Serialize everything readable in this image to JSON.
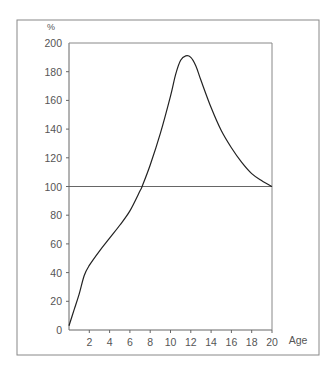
{
  "chart_data": {
    "type": "line",
    "title": "",
    "xlabel": "Age",
    "ylabel": "%",
    "xlim": [
      0,
      20
    ],
    "ylim": [
      0,
      200
    ],
    "x_ticks": [
      2,
      4,
      6,
      8,
      10,
      12,
      14,
      16,
      18,
      20
    ],
    "y_ticks": [
      0,
      20,
      40,
      60,
      80,
      100,
      120,
      140,
      160,
      180,
      200
    ],
    "grid": false,
    "legend": null,
    "reference_line": {
      "y": 100,
      "orientation": "horizontal"
    },
    "series": [
      {
        "name": "curve",
        "x": [
          0,
          0.5,
          1,
          1.5,
          2,
          3,
          4,
          5,
          6,
          7,
          7.2,
          8,
          9,
          10,
          10.5,
          11,
          11.5,
          12,
          12.5,
          13,
          14,
          15,
          16,
          17,
          18,
          19,
          20
        ],
        "values": [
          3,
          14,
          25,
          38,
          45,
          55,
          64,
          73,
          83,
          97,
          100,
          115,
          137,
          163,
          178,
          188,
          191,
          190,
          184,
          174,
          155,
          139,
          127,
          117,
          109,
          104,
          100
        ]
      }
    ]
  },
  "colors": {
    "line": "#222222",
    "axis": "#666666",
    "frame": "#888888",
    "text": "#555555"
  }
}
